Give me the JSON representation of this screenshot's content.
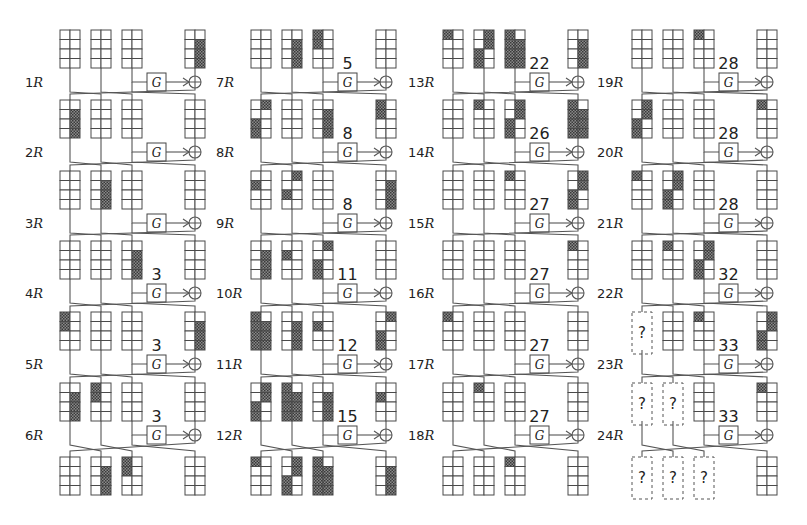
{
  "figure": {
    "colors": {
      "line": "#4a4a4a",
      "shade": "#555555",
      "background": "#ffffff"
    },
    "g_label": "G",
    "columns": [
      {
        "x": 60,
        "rounds": [
          {
            "label_num": "1",
            "label_suffix": "R",
            "count": ""
          },
          {
            "label_num": "2",
            "label_suffix": "R",
            "count": ""
          },
          {
            "label_num": "3",
            "label_suffix": "R",
            "count": ""
          },
          {
            "label_num": "4",
            "label_suffix": "R",
            "count": "3"
          },
          {
            "label_num": "5",
            "label_suffix": "R",
            "count": "3"
          },
          {
            "label_num": "6",
            "label_suffix": "R",
            "count": "3"
          }
        ],
        "states": [
          [
            [],
            [],
            [],
            [
              "1,1",
              "1,2",
              "1,3"
            ]
          ],
          [
            [
              "1,1",
              "1,2",
              "1,3"
            ],
            [],
            [],
            []
          ],
          [
            [],
            [
              "1,1",
              "1,2",
              "1,3"
            ],
            [],
            []
          ],
          [
            [],
            [],
            [
              "1,1",
              "1,2",
              "1,3"
            ],
            []
          ],
          [
            [
              "0,0",
              "0,1"
            ],
            [],
            [],
            [
              "1,1",
              "1,2",
              "1,3"
            ]
          ],
          [
            [
              "1,1",
              "1,2",
              "1,3"
            ],
            [
              "0,0",
              "0,1"
            ],
            [],
            []
          ],
          [
            [],
            [
              "1,1",
              "1,2",
              "1,3"
            ],
            [
              "0,0",
              "0,1"
            ],
            []
          ]
        ]
      },
      {
        "x": 251,
        "rounds": [
          {
            "label_num": "7",
            "label_suffix": "R",
            "count": "5"
          },
          {
            "label_num": "8",
            "label_suffix": "R",
            "count": "8"
          },
          {
            "label_num": "9",
            "label_suffix": "R",
            "count": "8"
          },
          {
            "label_num": "10",
            "label_suffix": "R",
            "count": "11"
          },
          {
            "label_num": "11",
            "label_suffix": "R",
            "count": "12"
          },
          {
            "label_num": "12",
            "label_suffix": "R",
            "count": "15"
          }
        ],
        "states": [
          [
            [],
            [
              "1,1",
              "1,2",
              "1,3"
            ],
            [
              "0,0",
              "0,1"
            ],
            []
          ],
          [
            [
              "1,0",
              "0,2",
              "0,3"
            ],
            [],
            [
              "1,1",
              "1,2",
              "1,3"
            ],
            [
              "0,0",
              "0,1"
            ]
          ],
          [
            [
              "0,1"
            ],
            [
              "1,0",
              "0,2"
            ],
            [],
            [
              "1,1",
              "1,2",
              "1,3"
            ]
          ],
          [
            [
              "1,1",
              "1,2",
              "1,3"
            ],
            [
              "0,1"
            ],
            [
              "1,0",
              "0,2",
              "0,3"
            ],
            []
          ],
          [
            [
              "0,0",
              "0,1",
              "0,2",
              "0,3",
              "1,1",
              "1,2",
              "1,3"
            ],
            [
              "1,1",
              "1,2",
              "1,3"
            ],
            [
              "0,1"
            ],
            [
              "1,0",
              "0,2",
              "0,3"
            ]
          ],
          [
            [
              "1,0",
              "1,1",
              "0,2",
              "0,3"
            ],
            [
              "0,0",
              "0,1",
              "0,2",
              "0,3",
              "1,1",
              "1,2",
              "1,3"
            ],
            [
              "1,1",
              "1,2",
              "1,3"
            ],
            [
              "0,1"
            ]
          ],
          [
            [
              "0,0"
            ],
            [
              "1,0",
              "1,1",
              "0,2",
              "0,3"
            ],
            [
              "0,0",
              "0,1",
              "0,2",
              "0,3",
              "1,1",
              "1,2",
              "1,3"
            ],
            [
              "1,1",
              "1,2",
              "1,3"
            ]
          ]
        ]
      },
      {
        "x": 443,
        "rounds": [
          {
            "label_num": "13",
            "label_suffix": "R",
            "count": "22"
          },
          {
            "label_num": "14",
            "label_suffix": "R",
            "count": "26"
          },
          {
            "label_num": "15",
            "label_suffix": "R",
            "count": "27"
          },
          {
            "label_num": "16",
            "label_suffix": "R",
            "count": "27"
          },
          {
            "label_num": "17",
            "label_suffix": "R",
            "count": "27"
          },
          {
            "label_num": "18",
            "label_suffix": "R",
            "count": "27"
          }
        ],
        "states": [
          [
            [
              "0,0"
            ],
            [
              "1,0",
              "1,1",
              "0,2",
              "0,3"
            ],
            [
              "0,0",
              "0,1",
              "0,2",
              "0,3",
              "1,1",
              "1,2",
              "1,3"
            ],
            [
              "1,1",
              "1,2",
              "1,3"
            ]
          ],
          [
            [],
            [
              "0,0"
            ],
            [
              "1,0",
              "1,1",
              "0,2",
              "0,3"
            ],
            [
              "0,0",
              "0,1",
              "0,2",
              "0,3",
              "1,1",
              "1,2",
              "1,3"
            ]
          ],
          [
            [],
            [],
            [
              "0,0"
            ],
            [
              "1,0",
              "1,1",
              "0,2",
              "0,3"
            ]
          ],
          [
            [],
            [],
            [],
            [
              "0,0"
            ]
          ],
          [
            [
              "0,0"
            ],
            [],
            [],
            []
          ],
          [
            [],
            [
              "0,0"
            ],
            [],
            []
          ],
          [
            [],
            [],
            [
              "0,0"
            ],
            []
          ]
        ]
      },
      {
        "x": 632,
        "rounds": [
          {
            "label_num": "19",
            "label_suffix": "R",
            "count": "28"
          },
          {
            "label_num": "20",
            "label_suffix": "R",
            "count": "28"
          },
          {
            "label_num": "21",
            "label_suffix": "R",
            "count": "28"
          },
          {
            "label_num": "22",
            "label_suffix": "R",
            "count": "32"
          },
          {
            "label_num": "23",
            "label_suffix": "R",
            "count": "33"
          },
          {
            "label_num": "24",
            "label_suffix": "R",
            "count": "33"
          }
        ],
        "states": [
          [
            [],
            [],
            [
              "0,0"
            ],
            []
          ],
          [
            [
              "1,0",
              "1,1",
              "0,2",
              "0,3"
            ],
            [],
            [],
            [
              "0,0"
            ]
          ],
          [
            [
              "0,0"
            ],
            [
              "1,0",
              "1,1",
              "0,2",
              "0,3"
            ],
            [],
            []
          ],
          [
            [],
            [
              "0,0"
            ],
            [
              "1,0",
              "1,1",
              "0,2",
              "0,3"
            ],
            []
          ],
          [
            "?",
            [],
            [
              "0,0"
            ],
            [
              "1,0",
              "1,1",
              "0,2",
              "0,3"
            ]
          ],
          [
            "?",
            "?",
            [],
            [
              "0,0"
            ]
          ],
          [
            "?",
            "?",
            "?",
            []
          ]
        ]
      }
    ],
    "unknown_symbol": "?"
  }
}
